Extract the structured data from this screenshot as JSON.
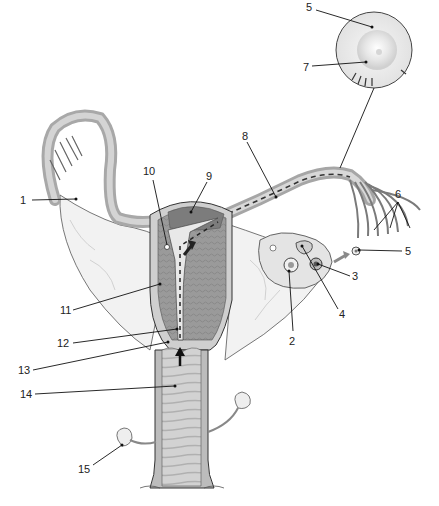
{
  "diagram": {
    "colors": {
      "background": "#ffffff",
      "ligament": "#f0f0f0",
      "tissue_light": "#d8d8d8",
      "tissue_mid": "#b4b4b4",
      "tissue_dark": "#8a8a8a",
      "outline": "#3a3a3a",
      "arrow": "#222222",
      "arrow_grey": "#8a8a8a"
    },
    "labels": [
      {
        "id": "1",
        "text": "1"
      },
      {
        "id": "2",
        "text": "2"
      },
      {
        "id": "3",
        "text": "3"
      },
      {
        "id": "4",
        "text": "4"
      },
      {
        "id": "5a",
        "text": "5"
      },
      {
        "id": "5b",
        "text": "5"
      },
      {
        "id": "6",
        "text": "6"
      },
      {
        "id": "7",
        "text": "7"
      },
      {
        "id": "8",
        "text": "8"
      },
      {
        "id": "9",
        "text": "9"
      },
      {
        "id": "10",
        "text": "10"
      },
      {
        "id": "11",
        "text": "11"
      },
      {
        "id": "12",
        "text": "12"
      },
      {
        "id": "13",
        "text": "13"
      },
      {
        "id": "14",
        "text": "14"
      },
      {
        "id": "15",
        "text": "15"
      }
    ]
  }
}
